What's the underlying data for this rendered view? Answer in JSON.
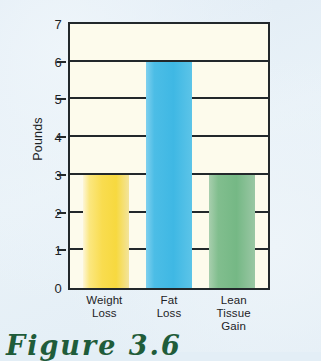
{
  "chart_data": {
    "type": "bar",
    "title": "",
    "xlabel": "",
    "ylabel": "Pounds",
    "ylim": [
      0,
      7
    ],
    "grid": true,
    "legend": false,
    "categories": [
      "Weight Loss",
      "Fat Loss",
      "Lean Tissue Gain"
    ],
    "category_lines": [
      [
        "Weight",
        "Loss"
      ],
      [
        "Fat",
        "Loss"
      ],
      [
        "Lean Tissue",
        "Gain"
      ]
    ],
    "values": [
      3,
      6,
      3
    ],
    "ytick_labels": [
      "7",
      "6",
      "5",
      "4",
      "3",
      "2",
      "1",
      "0"
    ],
    "ytick_values": [
      7,
      6,
      5,
      4,
      3,
      2,
      1,
      0
    ],
    "bar_colors": [
      "#f7d93f",
      "#4cbde6",
      "#7bbb89"
    ]
  },
  "caption": {
    "text": "Figure 3.6"
  },
  "colors": {
    "page_background": "#e3eef6",
    "plot_background": "#fdfbec",
    "axis": "#22282b",
    "text": "#1d2326",
    "caption": "#1f5c3a"
  }
}
